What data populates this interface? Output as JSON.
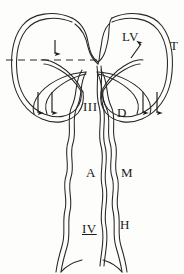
{
  "figure": {
    "background_color": "#fdfdfc",
    "line_color": "#262626",
    "label_color": "#1a1a1a"
  },
  "labels": [
    {
      "id": "lv",
      "text": "LV",
      "x": 122,
      "y": 30,
      "meaning": "left-ventral-lobe-label"
    },
    {
      "id": "t",
      "text": "T",
      "x": 170,
      "y": 39,
      "meaning": "t-label"
    },
    {
      "id": "iii",
      "text": "III",
      "x": 83,
      "y": 100,
      "meaning": "segment-three-label"
    },
    {
      "id": "d",
      "text": "D",
      "x": 117,
      "y": 106,
      "meaning": "d-label"
    },
    {
      "id": "a",
      "text": "A",
      "x": 86,
      "y": 166,
      "meaning": "a-label"
    },
    {
      "id": "m",
      "text": "M",
      "x": 121,
      "y": 166,
      "meaning": "m-label"
    },
    {
      "id": "iv",
      "text": "IV",
      "x": 82,
      "y": 222,
      "meaning": "segment-four-label-underlined"
    },
    {
      "id": "h",
      "text": "H",
      "x": 120,
      "y": 218,
      "meaning": "h-label"
    }
  ],
  "section_line": {
    "name": "horizontal-dashed-section-line",
    "x1": 6,
    "x2": 98,
    "y": 60,
    "dash_pattern": "7,5",
    "color": "#2b2b2b"
  },
  "arrows": [
    {
      "id": "left-lobe-arrow-upper",
      "direction": "down",
      "x": 55,
      "y_from": 40,
      "y_to": 55
    },
    {
      "id": "left-lobe-arrow-inner-1",
      "direction": "down",
      "x": 38,
      "y_from": 90,
      "y_to": 114
    },
    {
      "id": "left-lobe-arrow-inner-2",
      "direction": "down",
      "x": 52,
      "y_from": 90,
      "y_to": 114
    },
    {
      "id": "right-lobe-arrow-upper",
      "direction": "up-right",
      "x": 140,
      "y_from": 58,
      "y_to": 44
    },
    {
      "id": "right-lobe-arrow-inner-1",
      "direction": "down",
      "x": 143,
      "y_from": 90,
      "y_to": 114
    },
    {
      "id": "right-lobe-arrow-inner-2",
      "direction": "down",
      "x": 157,
      "y_from": 90,
      "y_to": 114
    }
  ],
  "structures": [
    {
      "id": "left-lobe-outer-contour",
      "type": "closed-loop",
      "side": "left"
    },
    {
      "id": "left-lobe-inner-contour",
      "type": "closed-loop",
      "side": "left"
    },
    {
      "id": "right-lobe-outer-contour",
      "type": "closed-loop",
      "side": "right"
    },
    {
      "id": "right-lobe-inner-contour",
      "type": "closed-loop",
      "side": "right"
    },
    {
      "id": "central-tube-left-wall",
      "type": "wavy-double-line"
    },
    {
      "id": "central-tube-right-wall",
      "type": "wavy-double-line"
    },
    {
      "id": "central-tube-midline",
      "type": "wavy-double-line"
    },
    {
      "id": "caudal-tail",
      "type": "tapering-tube"
    }
  ]
}
